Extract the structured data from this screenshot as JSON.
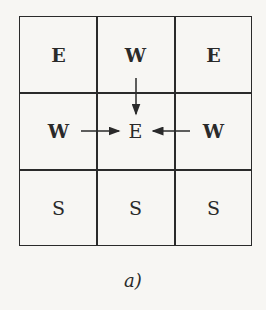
{
  "grid": {
    "rows": [
      [
        {
          "label": "E",
          "bold": true
        },
        {
          "label": "W",
          "bold": true
        },
        {
          "label": "E",
          "bold": true
        }
      ],
      [
        {
          "label": "W",
          "bold": true
        },
        {
          "label": "E",
          "bold": false
        },
        {
          "label": "W",
          "bold": true
        }
      ],
      [
        {
          "label": "S",
          "bold": false
        },
        {
          "label": "S",
          "bold": false
        },
        {
          "label": "S",
          "bold": false
        }
      ]
    ]
  },
  "arrows": [
    {
      "from": "row0-col1",
      "to": "row1-col1",
      "direction": "down"
    },
    {
      "from": "row1-col0",
      "to": "row1-col1",
      "direction": "right"
    },
    {
      "from": "row1-col2",
      "to": "row1-col1",
      "direction": "left"
    }
  ],
  "caption": "a)"
}
